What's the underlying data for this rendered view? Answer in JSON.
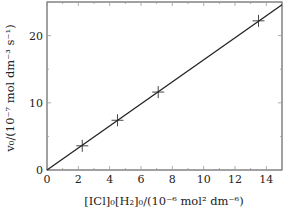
{
  "chart_data": {
    "type": "scatter",
    "title": "",
    "xlabel": "[ICl]₀[H₂]₀/(10⁻⁶ mol² dm⁻⁶)",
    "ylabel": "v₀/(10⁻⁷ mol dm⁻³ s⁻¹)",
    "xlim": [
      0,
      15
    ],
    "ylim": [
      0,
      25
    ],
    "xticks": [
      0,
      2,
      4,
      6,
      8,
      10,
      12,
      14
    ],
    "yticks": [
      0,
      10,
      20
    ],
    "grid": false,
    "legend": null,
    "series": [
      {
        "name": "measured",
        "marker": "plus",
        "x": [
          2.25,
          4.5,
          7.1,
          13.5
        ],
        "y": [
          3.6,
          7.4,
          11.6,
          22.2
        ]
      },
      {
        "name": "fit line",
        "marker": "none",
        "x": [
          0,
          15
        ],
        "y": [
          0,
          24.6
        ]
      }
    ],
    "colors": {
      "line": "#222222",
      "axes": "#444444"
    }
  },
  "labels": {
    "x_axis": "[ICl]₀[H₂]₀/(10⁻⁶ mol² dm⁻⁶)",
    "y_axis": "v₀/(10⁻⁷ mol dm⁻³ s⁻¹)"
  }
}
